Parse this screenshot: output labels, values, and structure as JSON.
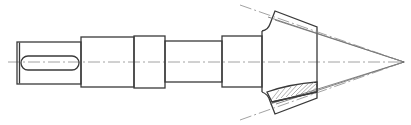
{
  "drawing": {
    "title": "Bevel gear shaft — technical drawing",
    "colors": {
      "outline": "#3a3a3a",
      "thin_line": "#6a6a6a",
      "center_line": "#8a8a8a",
      "background": "#ffffff"
    },
    "centerline_y": 62,
    "shaft_segments": [
      {
        "name": "keyed-end",
        "x1": 17,
        "x2": 81,
        "y_top": 42,
        "y_bottom": 84
      },
      {
        "name": "bearing-journal",
        "x1": 81,
        "x2": 134,
        "y_top": 37,
        "y_bottom": 87
      },
      {
        "name": "collar",
        "x1": 134,
        "x2": 165,
        "y_top": 36,
        "y_bottom": 88
      },
      {
        "name": "neck",
        "x1": 165,
        "x2": 222,
        "y_top": 41,
        "y_bottom": 82
      },
      {
        "name": "gear-seat",
        "x1": 222,
        "x2": 262,
        "y_top": 36,
        "y_bottom": 87
      }
    ],
    "keyway": {
      "x1": 21,
      "x2": 79,
      "y_top": 56,
      "y_bottom": 70
    },
    "bevel_gear": {
      "back_face_x": 275,
      "front_face_x": 317,
      "back_top_y": 11,
      "back_bottom_y": 114,
      "front_top_y": 27,
      "front_bottom_y": 98,
      "apex_x": 404,
      "apex_y": 62
    }
  }
}
